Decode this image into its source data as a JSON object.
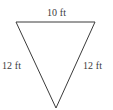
{
  "figure": {
    "kind": "triangle-diagram",
    "shape_name": "inverted-isosceles-triangle",
    "background_color": "#ffffff",
    "stroke_color": "#3b3b3b",
    "stroke_width": 1,
    "canvas": {
      "width": 113,
      "height": 110
    },
    "vertices": {
      "top_left": {
        "x": 16,
        "y": 22
      },
      "top_right": {
        "x": 95,
        "y": 22
      },
      "bottom": {
        "x": 56,
        "y": 108
      }
    },
    "labels": {
      "top": "10 ft",
      "left": "12 ft",
      "right": "12 ft"
    },
    "label_color": "#3b3b3b"
  }
}
